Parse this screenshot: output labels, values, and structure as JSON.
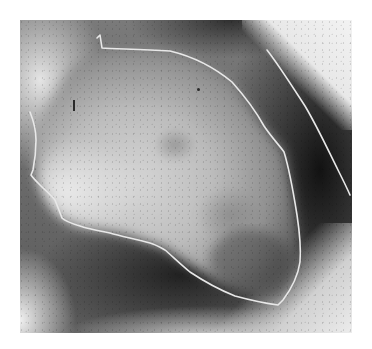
{
  "figure": {
    "type": "grayscale radiograph (left ventriculogram)",
    "frame": {
      "x": 20,
      "y": 20,
      "width": 332,
      "height": 313
    },
    "colors": {
      "page_background": "#ffffff",
      "bright_tissue": "#e6e6e6",
      "contrast_fill": "#c8c8c8",
      "dark_field": "#141414",
      "outline_stroke": "#e8e8e8"
    },
    "annotations": [
      {
        "name": "ventricular-outline",
        "description": "white traced contour around opacified chamber",
        "points": [
          [
            97,
            38
          ],
          [
            100,
            35
          ],
          [
            102,
            48
          ],
          [
            110,
            49
          ],
          [
            140,
            49
          ],
          [
            170,
            51
          ],
          [
            200,
            61
          ],
          [
            230,
            80
          ],
          [
            262,
            125
          ],
          [
            284,
            150
          ],
          [
            292,
            190
          ],
          [
            301,
            240
          ],
          [
            300,
            262
          ],
          [
            295,
            280
          ],
          [
            283,
            300
          ],
          [
            278,
            305
          ],
          [
            250,
            300
          ],
          [
            220,
            290
          ],
          [
            190,
            272
          ],
          [
            165,
            250
          ],
          [
            150,
            243
          ],
          [
            130,
            238
          ],
          [
            110,
            233
          ],
          [
            80,
            226
          ],
          [
            62,
            218
          ],
          [
            55,
            200
          ],
          [
            40,
            185
          ],
          [
            31,
            175
          ],
          [
            33,
            170
          ],
          [
            36,
            150
          ],
          [
            35,
            130
          ],
          [
            30,
            112
          ]
        ]
      },
      {
        "name": "epicardial-outline",
        "description": "white traced line along outer cardiac border",
        "points": [
          [
            267,
            50
          ],
          [
            285,
            75
          ],
          [
            305,
            105
          ],
          [
            325,
            145
          ],
          [
            340,
            172
          ],
          [
            350,
            195
          ]
        ]
      }
    ]
  }
}
